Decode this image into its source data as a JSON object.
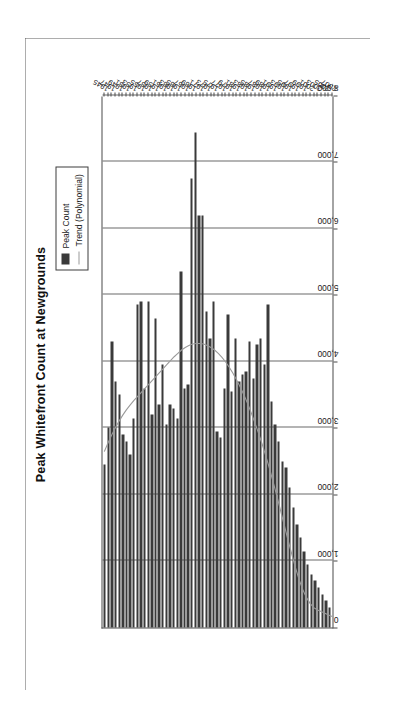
{
  "chart_data": {
    "type": "bar",
    "orientation": "vertical-rotated",
    "title": "Peak Whitefront Count at Newgrounds",
    "xlabel": "",
    "ylabel": "",
    "grid": true,
    "legend_position": "top-right",
    "ylim": [
      0,
      8000
    ],
    "y_ticks": [
      "0",
      "1,000",
      "2,000",
      "3,000",
      "4,000",
      "5,000",
      "6,000",
      "7,000",
      "8,000"
    ],
    "y_tick_values": [
      0,
      1000,
      2000,
      3000,
      4000,
      5000,
      6000,
      7000,
      8000
    ],
    "category_label_step": 2,
    "categories": [
      "1945",
      "1946",
      "1947",
      "1948",
      "1949",
      "1950",
      "1951",
      "1952",
      "1953",
      "1954",
      "1955",
      "1956",
      "1957",
      "1958",
      "1959",
      "1960",
      "1961",
      "1962",
      "1963",
      "1964",
      "1965",
      "1966",
      "1967",
      "1968",
      "1969",
      "1970",
      "1971",
      "1972",
      "1973",
      "1974",
      "1975",
      "1976",
      "1977",
      "1978",
      "1979",
      "1980",
      "1981",
      "1982",
      "1983",
      "1984",
      "1985",
      "1986",
      "1987",
      "1988",
      "1989",
      "1990",
      "1991",
      "1992",
      "1993",
      "1994",
      "1995",
      "1996",
      "1997",
      "1998",
      "1999",
      "2000",
      "2001",
      "2002",
      "2003",
      "2004",
      "2005",
      "2006",
      "2007"
    ],
    "series": [
      {
        "name": "Peak Count",
        "color": "#3a3a3a",
        "values": [
          2450,
          3000,
          4300,
          3700,
          3500,
          2900,
          2800,
          2600,
          3150,
          4850,
          4900,
          3600,
          4900,
          3200,
          4650,
          3350,
          3950,
          3050,
          3350,
          3300,
          3150,
          5350,
          3600,
          3650,
          6750,
          7450,
          6200,
          6200,
          4750,
          4350,
          4900,
          2950,
          2850,
          3600,
          4700,
          3550,
          4350,
          3700,
          3800,
          3850,
          4300,
          3750,
          4250,
          4350,
          3950,
          4850,
          3400,
          3050,
          2800,
          2500,
          2400,
          2100,
          1800,
          1550,
          1350,
          1150,
          950,
          800,
          700,
          600,
          500,
          400,
          300
        ]
      },
      {
        "name": "Trend (Polynomial)",
        "color": "#9a9a9a",
        "type": "line",
        "values": [
          2650,
          2780,
          2900,
          3010,
          3110,
          3200,
          3280,
          3350,
          3420,
          3480,
          3540,
          3600,
          3660,
          3720,
          3780,
          3840,
          3900,
          3960,
          4020,
          4080,
          4130,
          4180,
          4220,
          4250,
          4270,
          4280,
          4280,
          4270,
          4250,
          4220,
          4180,
          4130,
          4070,
          4000,
          3920,
          3830,
          3730,
          3620,
          3500,
          3370,
          3230,
          3080,
          2920,
          2750,
          2570,
          2380,
          2180,
          1970,
          1750,
          1530,
          1310,
          1100,
          900,
          720,
          570,
          450,
          360,
          300,
          265,
          240,
          215,
          190,
          165
        ]
      }
    ]
  },
  "legend": {
    "items": [
      {
        "label": "Peak Count",
        "marker": "bar-swatch"
      },
      {
        "label": "Trend (Polynomial)",
        "marker": "line-swatch"
      }
    ]
  }
}
